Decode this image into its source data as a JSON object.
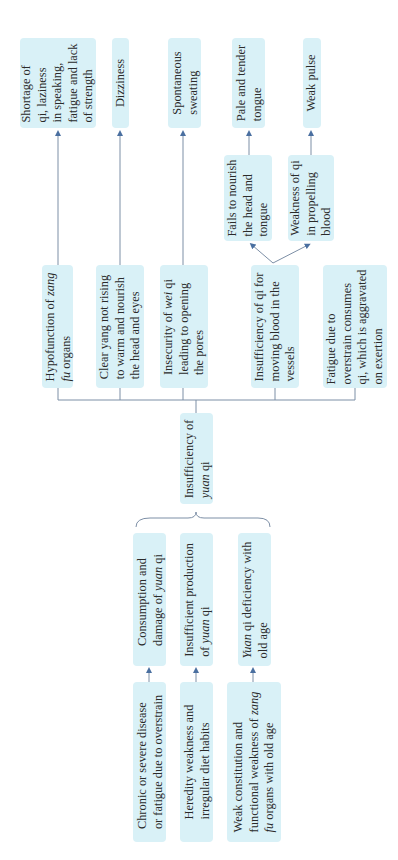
{
  "diagram": {
    "center": {
      "lines": [
        "Insufficiency of",
        "<i>yuan</i> qi"
      ]
    },
    "causes_mid": [
      {
        "lines": [
          "Consumption and",
          "damage of <i>yuan</i> qi"
        ]
      },
      {
        "lines": [
          "Insufficient production",
          "of <i>yuan</i> qi"
        ]
      },
      {
        "lines": [
          "<i>Yuan</i> qi deficiency with",
          "old age"
        ]
      }
    ],
    "causes_root": [
      {
        "lines": [
          "Chronic or severe disease",
          "or fatigue due to overstrain"
        ]
      },
      {
        "lines": [
          "Heredity weakness and",
          "irregular diet habits"
        ]
      },
      {
        "lines": [
          "Weak constitution and",
          "functional weakness of <i>zang</i>",
          "<i>fu</i> organs with old age"
        ]
      }
    ],
    "mechanisms": [
      {
        "lines": [
          "Hypofunction of <i>zang</i>",
          "<i>fu</i> organs"
        ]
      },
      {
        "lines": [
          "Clear yang not rising",
          "to warm and nourish",
          "the head and eyes"
        ]
      },
      {
        "lines": [
          "Insecurity of <i>wei</i> qi",
          "leading to opening",
          "the pores"
        ]
      },
      {
        "lines": [
          "Insufficiency of qi for",
          "moving blood in the",
          "vessels"
        ]
      },
      {
        "lines": [
          "Fatigue due to",
          "overstrain consumes",
          "qi, which is aggravated",
          "on exertion"
        ]
      }
    ],
    "sub_mechanisms": [
      {
        "lines": [
          "Fails to nourish",
          "the head and",
          "tongue"
        ]
      },
      {
        "lines": [
          "Weakness of qi",
          "in propelling",
          "blood"
        ]
      }
    ],
    "symptoms": [
      {
        "lines": [
          "Shortage of",
          "qi, laziness",
          "in speaking,",
          "fatigue and lack",
          "of strength"
        ]
      },
      {
        "lines": [
          "Dizziness"
        ]
      },
      {
        "lines": [
          "Spontaneous",
          "sweating"
        ]
      },
      {
        "lines": [
          "Pale and tender",
          "tongue"
        ]
      },
      {
        "lines": [
          "Weak pulse"
        ]
      }
    ],
    "colors": {
      "box_fill": "#d9f1f7",
      "line": "#7d8fa6",
      "arrow": "#4a6fa0"
    }
  }
}
